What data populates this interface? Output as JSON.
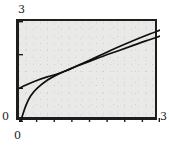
{
  "figure": {
    "background_color": "#ffffff",
    "plot_background_color": "#e9e9e7",
    "frame_color": "#1d1d1d",
    "curve_color": "#101010"
  },
  "labels": {
    "y_max": "3",
    "y_min": "0",
    "x_min": "0",
    "x_max": "3"
  },
  "chart_data": {
    "type": "line",
    "title": "",
    "xlabel": "",
    "ylabel": "",
    "xlim": [
      0,
      3
    ],
    "ylim": [
      0,
      3
    ],
    "grid": false,
    "legend": "none",
    "xticks": [
      0,
      0.375,
      0.75,
      1.125,
      1.5,
      1.875,
      2.25,
      2.625,
      3
    ],
    "xticklabels": [
      "0",
      "",
      "",
      "",
      "",
      "",
      "",
      "",
      "3"
    ],
    "yticks": [
      0,
      1,
      2,
      3
    ],
    "yticklabels": [
      "0",
      "",
      "",
      "3"
    ],
    "series": [
      {
        "name": "curve-lower",
        "description": "concave increasing curve rising steeply from near zero",
        "x": [
          0.04,
          0.08,
          0.15,
          0.25,
          0.4,
          0.6,
          0.8,
          1.0,
          1.25,
          1.5,
          1.8,
          2.1,
          2.4,
          2.7,
          3.0
        ],
        "y": [
          0.02,
          0.22,
          0.5,
          0.78,
          1.02,
          1.24,
          1.4,
          1.52,
          1.67,
          1.8,
          1.96,
          2.11,
          2.26,
          2.41,
          2.55
        ]
      },
      {
        "name": "curve-upper",
        "description": "concave increasing curve starting at y=1 on the left axis",
        "x": [
          0.0,
          0.15,
          0.35,
          0.6,
          0.8,
          1.0,
          1.25,
          1.5,
          1.8,
          2.1,
          2.4,
          2.7,
          3.0
        ],
        "y": [
          1.0,
          1.1,
          1.22,
          1.34,
          1.42,
          1.52,
          1.68,
          1.83,
          2.03,
          2.22,
          2.4,
          2.57,
          2.73
        ]
      }
    ]
  }
}
